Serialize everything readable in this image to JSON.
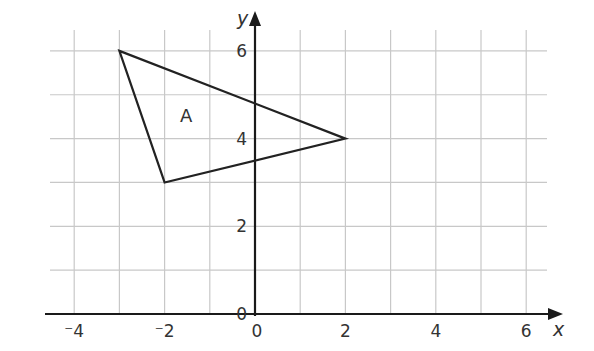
{
  "diagram": {
    "type": "coordinate-grid",
    "x_axis": {
      "label": "x",
      "min": -4.5,
      "max": 6.5,
      "ticks": [
        -4,
        -2,
        0,
        2,
        4,
        6
      ],
      "tick_labels": [
        "⁻4",
        "⁻2",
        "0",
        "2",
        "4",
        "6"
      ]
    },
    "y_axis": {
      "label": "y",
      "min": 0,
      "max": 6.5,
      "ticks": [
        0,
        2,
        4,
        6
      ],
      "tick_labels": [
        "0",
        "2",
        "4",
        "6"
      ]
    },
    "grid": {
      "x_step": 1,
      "y_step": 1,
      "color": "#c8c8c8"
    },
    "shapes": [
      {
        "name": "A",
        "type": "triangle",
        "vertices": [
          [
            -3,
            6
          ],
          [
            2,
            4
          ],
          [
            -2,
            3
          ]
        ],
        "label": "A",
        "label_pos": [
          -1.5,
          4.5
        ]
      }
    ],
    "colors": {
      "axis": "#1a1a1a",
      "shape": "#222222",
      "text": "#333333"
    }
  }
}
